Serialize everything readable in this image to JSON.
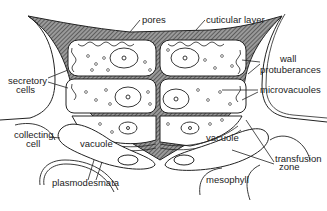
{
  "diagram": {
    "labels": {
      "pores": "pores",
      "cuticular_layer": "cuticular layer",
      "wall": "wall",
      "protuberances": "protuberances",
      "microvacuoles": "microvacuoles",
      "secretory": "secretory",
      "cells": "cells",
      "collecting": "collecting",
      "cell": "cell",
      "vacuole_left": "vacuole",
      "vacuole_right": "vacuole",
      "transfusion": "transfusion",
      "zone": "zone",
      "plasmodesmata": "plasmodesmata",
      "mesophyll": "mesophyll"
    },
    "colors": {
      "ink": "#222222",
      "background": "#ffffff",
      "hatch": "#555555"
    }
  }
}
